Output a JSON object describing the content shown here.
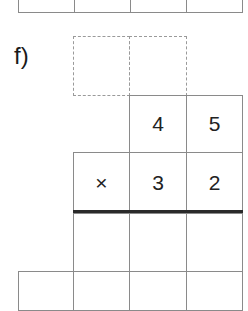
{
  "exercise": {
    "label": "f)",
    "multiplicand": [
      "4",
      "5"
    ],
    "operator": "×",
    "multiplier": [
      "3",
      "2"
    ],
    "carry_boxes": [
      "",
      ""
    ],
    "partial_product_1": [
      "",
      "",
      ""
    ],
    "partial_product_2": [
      "",
      "",
      "",
      ""
    ]
  },
  "colors": {
    "grid": "#8a8a8a",
    "dashed": "#9a9a9a",
    "rule": "#2a2a2a",
    "text": "#222222"
  }
}
